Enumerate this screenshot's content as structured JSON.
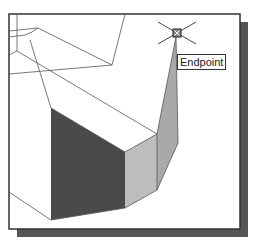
{
  "viewport": {
    "background": "#ffffff",
    "frame": {
      "x": 9,
      "y": 14,
      "width": 231,
      "height": 215,
      "stroke": "#333333"
    },
    "shadow": {
      "offset": 8,
      "color": "#555555"
    }
  },
  "model": {
    "faces": [
      {
        "name": "front-left-face",
        "points": "51,108 125,152 125,208 51,220",
        "fill": "#4a4a4a"
      },
      {
        "name": "front-middle-face",
        "points": "125,152 157,134 157,190 125,208",
        "fill": "#bdbdbd"
      },
      {
        "name": "right-side-face",
        "points": "157,134 176,37 178,143 157,190",
        "fill": "#a9a9a9"
      }
    ],
    "edges": [
      "17,14 17,51",
      "9,31 38,28",
      "9,37 25,35 32,32 38,28",
      "38,28 112,65",
      "125,14 112,65",
      "112,65 9,74",
      "17,51 9,55",
      "17,51 157,134",
      "30,40 51,108",
      "9,192 51,220",
      "51,220 125,208",
      "125,208 157,190",
      "157,134 157,190",
      "125,152 157,134",
      "51,108 125,152",
      "157,134 176,37",
      "176,37 178,143",
      "178,143 157,190"
    ]
  },
  "snap": {
    "marker": {
      "cx": 177,
      "cy": 33,
      "size": 8
    },
    "crosshair_arms": [
      "158,22 196,44",
      "196,22 158,44"
    ],
    "tooltip_label": "Endpoint"
  }
}
